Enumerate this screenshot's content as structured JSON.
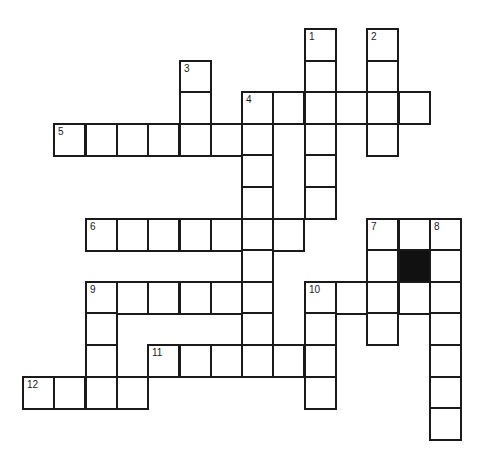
{
  "puzzle": {
    "cells": [
      {
        "col": 9,
        "row": 0,
        "num": "1"
      },
      {
        "col": 11,
        "row": 0,
        "num": "2"
      },
      {
        "col": 9,
        "row": 1
      },
      {
        "col": 11,
        "row": 1
      },
      {
        "col": 5,
        "row": 1,
        "num": "3"
      },
      {
        "col": 5,
        "row": 2
      },
      {
        "col": 7,
        "row": 2,
        "num": "4"
      },
      {
        "col": 8,
        "row": 2
      },
      {
        "col": 9,
        "row": 2
      },
      {
        "col": 10,
        "row": 2
      },
      {
        "col": 11,
        "row": 2
      },
      {
        "col": 12,
        "row": 2
      },
      {
        "col": 1,
        "row": 3,
        "num": "5"
      },
      {
        "col": 2,
        "row": 3
      },
      {
        "col": 3,
        "row": 3
      },
      {
        "col": 4,
        "row": 3
      },
      {
        "col": 5,
        "row": 3
      },
      {
        "col": 6,
        "row": 3
      },
      {
        "col": 7,
        "row": 3
      },
      {
        "col": 9,
        "row": 3
      },
      {
        "col": 11,
        "row": 3
      },
      {
        "col": 7,
        "row": 4
      },
      {
        "col": 9,
        "row": 4
      },
      {
        "col": 7,
        "row": 5
      },
      {
        "col": 9,
        "row": 5
      },
      {
        "col": 2,
        "row": 6,
        "num": "6"
      },
      {
        "col": 3,
        "row": 6
      },
      {
        "col": 4,
        "row": 6
      },
      {
        "col": 5,
        "row": 6
      },
      {
        "col": 6,
        "row": 6
      },
      {
        "col": 7,
        "row": 6
      },
      {
        "col": 8,
        "row": 6
      },
      {
        "col": 11,
        "row": 6,
        "num": "7"
      },
      {
        "col": 12,
        "row": 6
      },
      {
        "col": 13,
        "row": 6,
        "num": "8"
      },
      {
        "col": 7,
        "row": 7
      },
      {
        "col": 11,
        "row": 7
      },
      {
        "col": 12,
        "row": 7,
        "black": true
      },
      {
        "col": 13,
        "row": 7
      },
      {
        "col": 2,
        "row": 8,
        "num": "9"
      },
      {
        "col": 3,
        "row": 8
      },
      {
        "col": 4,
        "row": 8
      },
      {
        "col": 5,
        "row": 8
      },
      {
        "col": 6,
        "row": 8
      },
      {
        "col": 7,
        "row": 8
      },
      {
        "col": 9,
        "row": 8,
        "num": "10"
      },
      {
        "col": 10,
        "row": 8
      },
      {
        "col": 11,
        "row": 8
      },
      {
        "col": 12,
        "row": 8
      },
      {
        "col": 13,
        "row": 8
      },
      {
        "col": 2,
        "row": 9
      },
      {
        "col": 7,
        "row": 9
      },
      {
        "col": 9,
        "row": 9
      },
      {
        "col": 11,
        "row": 9
      },
      {
        "col": 13,
        "row": 9
      },
      {
        "col": 2,
        "row": 10
      },
      {
        "col": 4,
        "row": 10,
        "num": "11"
      },
      {
        "col": 5,
        "row": 10
      },
      {
        "col": 6,
        "row": 10
      },
      {
        "col": 7,
        "row": 10
      },
      {
        "col": 8,
        "row": 10
      },
      {
        "col": 9,
        "row": 10
      },
      {
        "col": 13,
        "row": 10
      },
      {
        "col": 0,
        "row": 11,
        "num": "12"
      },
      {
        "col": 1,
        "row": 11
      },
      {
        "col": 2,
        "row": 11
      },
      {
        "col": 3,
        "row": 11
      },
      {
        "col": 9,
        "row": 11
      },
      {
        "col": 13,
        "row": 11
      },
      {
        "col": 13,
        "row": 12
      }
    ]
  }
}
